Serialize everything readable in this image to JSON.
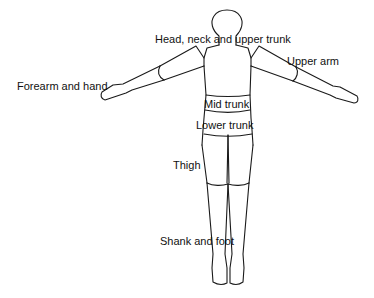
{
  "diagram": {
    "labels": {
      "head_neck_upper_trunk": "Head, neck and upper trunk",
      "upper_arm": "Upper arm",
      "forearm_hand": "Forearm and hand",
      "mid_trunk": "Mid trunk",
      "lower_trunk": "Lower trunk",
      "thigh": "Thigh",
      "shank_foot": "Shank and foot"
    },
    "colors": {
      "line": "#1a1a1a",
      "background": "#ffffff",
      "text": "#111111"
    }
  }
}
